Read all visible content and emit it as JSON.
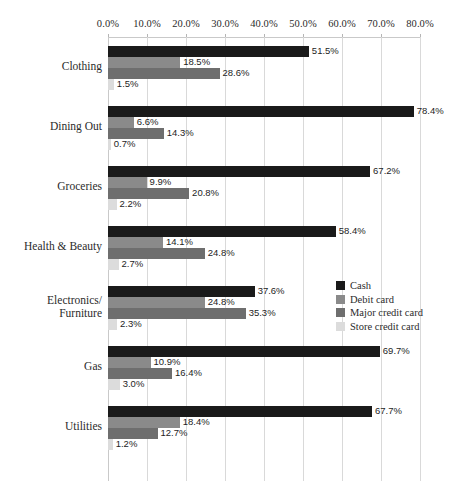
{
  "chart_data": {
    "type": "bar",
    "orientation": "horizontal",
    "grouped": true,
    "title": "",
    "subtitle": "",
    "xlabel": "",
    "ylabel": "",
    "xlim": [
      0,
      80
    ],
    "xtick_step": 10,
    "grid": true,
    "axis_position": "top",
    "legend_position": "right",
    "value_format": "percent-1dp",
    "xticks": [
      "0.0%",
      "10.0%",
      "20.0%",
      "30.0%",
      "40.0%",
      "50.0%",
      "60.0%",
      "70.0%",
      "80.0%"
    ],
    "xtick_values": [
      0,
      10,
      20,
      30,
      40,
      50,
      60,
      70,
      80
    ],
    "categories": [
      "Clothing",
      "Dining Out",
      "Groceries",
      "Health & Beauty",
      "Electronics/\nFurniture",
      "Gas",
      "Utilities"
    ],
    "series": [
      {
        "name": "Cash",
        "color": "#1a1a1a",
        "values": [
          51.5,
          78.4,
          67.2,
          58.4,
          37.6,
          69.7,
          67.7
        ],
        "labels": [
          "51.5%",
          "78.4%",
          "67.2%",
          "58.4%",
          "37.6%",
          "69.7%",
          "67.7%"
        ]
      },
      {
        "name": "Debit card",
        "color": "#8a8a8a",
        "values": [
          18.5,
          6.6,
          9.9,
          14.1,
          24.8,
          10.9,
          18.4
        ],
        "labels": [
          "18.5%",
          "6.6%",
          "9.9%",
          "14.1%",
          "24.8%",
          "10.9%",
          "18.4%"
        ]
      },
      {
        "name": "Major credit card",
        "color": "#6e6e6e",
        "values": [
          28.6,
          14.3,
          20.8,
          24.8,
          35.3,
          16.4,
          12.7
        ],
        "labels": [
          "28.6%",
          "14.3%",
          "20.8%",
          "24.8%",
          "35.3%",
          "16.4%",
          "12.7%"
        ]
      },
      {
        "name": "Store credit card",
        "color": "#dcdcdc",
        "values": [
          1.5,
          0.7,
          2.2,
          2.7,
          2.3,
          3.0,
          1.2
        ],
        "labels": [
          "1.5%",
          "0.7%",
          "2.2%",
          "2.7%",
          "2.3%",
          "3.0%",
          "1.2%"
        ]
      }
    ]
  },
  "legend": {
    "items": [
      {
        "label": "Cash",
        "color": "#1a1a1a"
      },
      {
        "label": "Debit card",
        "color": "#8a8a8a"
      },
      {
        "label": "Major credit card",
        "color": "#6e6e6e"
      },
      {
        "label": "Store credit card",
        "color": "#dcdcdc"
      }
    ]
  },
  "colors": {
    "background": "#ffffff",
    "gridline": "#d9d9d9",
    "axis": "#c9c9c9",
    "text": "#2b2b2b"
  }
}
